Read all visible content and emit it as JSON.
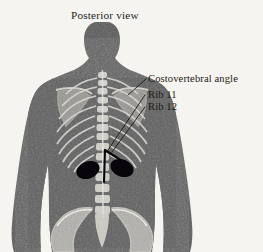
{
  "figure": {
    "title": "Posterior view",
    "domain_description": "Grayscale anatomical illustration of a human back with skeletal overlay",
    "background_color": "#f6f4f0",
    "body_color": "#5a5a5a",
    "bone_color": "#d8d6d0",
    "marker_color": "#08060a",
    "label_color": "#1d1a17"
  },
  "labels": [
    {
      "id": "costovertebral-angle",
      "text": "Costovertebral angle",
      "x": 148,
      "y": 82
    },
    {
      "id": "rib-11",
      "text": "Rib 11",
      "x": 148,
      "y": 98
    },
    {
      "id": "rib-12",
      "text": "Rib 12",
      "x": 148,
      "y": 110
    }
  ],
  "leaders": [
    {
      "id": "leader-costovertebral-angle",
      "d": "M146,79 L128,95"
    },
    {
      "id": "leader-rib-11",
      "d": "M145,95 L108,150"
    },
    {
      "id": "leader-rib-12",
      "d": "M145,107 L112,152"
    }
  ],
  "anatomy": {
    "kidney_left": {
      "cx": 88,
      "cy": 170,
      "rx": 12,
      "ry": 8.5,
      "rotation": -22
    },
    "kidney_right": {
      "cx": 122,
      "cy": 168,
      "rx": 12,
      "ry": 8.5,
      "rotation": 22
    },
    "angle_marker": {
      "apex_x": 105,
      "apex_y": 150
    }
  }
}
